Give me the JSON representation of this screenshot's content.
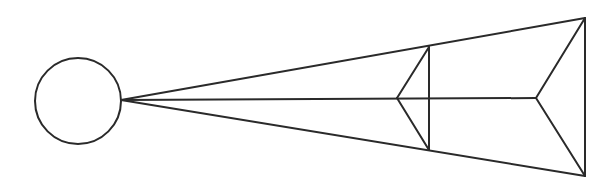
{
  "diagram": {
    "type": "geometric-cone-projection",
    "stroke_color": "#2a2a2a",
    "background": "#ffffff",
    "labels": [],
    "circle": {
      "cx": 78,
      "cy": 101,
      "r": 43
    },
    "apex": {
      "x": 121,
      "y": 100
    },
    "outer_frame": {
      "top": {
        "x": 585,
        "y": 18
      },
      "bottom": {
        "x": 585,
        "y": 176
      },
      "chevron_tip": {
        "x": 536,
        "y": 98
      }
    },
    "inner_frame": {
      "top": {
        "x": 429,
        "y": 47
      },
      "bottom": {
        "x": 429,
        "y": 150
      },
      "chevron_tip": {
        "x": 397,
        "y": 98
      }
    }
  }
}
